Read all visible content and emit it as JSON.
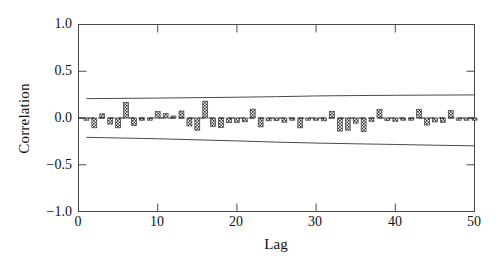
{
  "chart_data": {
    "type": "bar",
    "title": "",
    "subtitle": "",
    "xlabel": "Lag",
    "ylabel": "Correlation",
    "xlim": [
      0,
      50
    ],
    "ylim": [
      -1.0,
      1.0
    ],
    "grid": false,
    "legend": null,
    "xticks": [
      0,
      10,
      20,
      30,
      40,
      50
    ],
    "xtick_labels": [
      "0",
      "10",
      "20",
      "30",
      "40",
      "50"
    ],
    "yticks": [
      -1.0,
      -0.5,
      0.0,
      0.5,
      1.0
    ],
    "ytick_labels": [
      "−1.0",
      "−0.5",
      "0.0",
      "0.5",
      "1.0"
    ],
    "zero_line": {
      "value": 0.0,
      "style": "dashed",
      "color": "#1a1a1a"
    },
    "bar_style": {
      "fill": "crosshatch",
      "color": "#3a3a3a",
      "width_units": 0.62
    },
    "confidence_bands": {
      "style": "solid",
      "color": "#4a4a4a",
      "upper": [
        {
          "x": 1,
          "y": 0.207
        },
        {
          "x": 10,
          "y": 0.213
        },
        {
          "x": 20,
          "y": 0.222
        },
        {
          "x": 25,
          "y": 0.228
        },
        {
          "x": 30,
          "y": 0.236
        },
        {
          "x": 35,
          "y": 0.24
        },
        {
          "x": 40,
          "y": 0.243
        },
        {
          "x": 45,
          "y": 0.245
        },
        {
          "x": 50,
          "y": 0.247
        }
      ],
      "lower": [
        {
          "x": 1,
          "y": -0.207
        },
        {
          "x": 10,
          "y": -0.222
        },
        {
          "x": 20,
          "y": -0.245
        },
        {
          "x": 25,
          "y": -0.258
        },
        {
          "x": 30,
          "y": -0.268
        },
        {
          "x": 35,
          "y": -0.276
        },
        {
          "x": 40,
          "y": -0.283
        },
        {
          "x": 45,
          "y": -0.291
        },
        {
          "x": 50,
          "y": -0.298
        }
      ]
    },
    "categories": [
      1,
      2,
      3,
      4,
      5,
      6,
      7,
      8,
      9,
      10,
      11,
      12,
      13,
      14,
      15,
      16,
      17,
      18,
      19,
      20,
      21,
      22,
      23,
      24,
      25,
      26,
      27,
      28,
      29,
      30,
      31,
      32,
      33,
      34,
      35,
      36,
      37,
      38,
      39,
      40,
      41,
      42,
      43,
      44,
      45,
      46,
      47,
      48,
      49,
      50
    ],
    "values": [
      -0.015,
      -0.105,
      0.045,
      -0.065,
      -0.105,
      0.165,
      -0.08,
      -0.02,
      -0.012,
      0.068,
      0.048,
      0.022,
      0.075,
      -0.085,
      -0.13,
      0.18,
      -0.09,
      -0.1,
      -0.05,
      -0.048,
      -0.04,
      0.095,
      -0.095,
      -0.03,
      -0.028,
      -0.045,
      -0.018,
      -0.105,
      -0.02,
      -0.024,
      -0.03,
      0.072,
      -0.14,
      -0.13,
      -0.055,
      -0.145,
      -0.035,
      0.09,
      -0.028,
      -0.035,
      -0.02,
      -0.022,
      0.092,
      -0.075,
      -0.042,
      -0.048,
      0.082,
      -0.01,
      -0.012,
      -0.014
    ]
  }
}
